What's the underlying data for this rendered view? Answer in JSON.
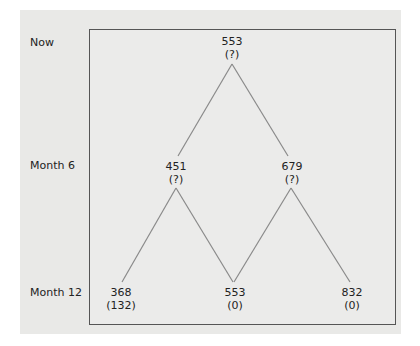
{
  "rows": [
    {
      "label": "Now"
    },
    {
      "label": "Month 6"
    },
    {
      "label": "Month 12"
    }
  ],
  "nodes": {
    "root": {
      "value": "553",
      "sub": "(?)"
    },
    "m6_low": {
      "value": "451",
      "sub": "(?)"
    },
    "m6_high": {
      "value": "679",
      "sub": "(?)"
    },
    "m12_low": {
      "value": "368",
      "sub": "(132)"
    },
    "m12_mid": {
      "value": "553",
      "sub": "(0)"
    },
    "m12_high": {
      "value": "832",
      "sub": "(0)"
    }
  },
  "colors": {
    "line": "#8a8a8a",
    "border": "#555555",
    "panel": "#e9e9e7"
  }
}
